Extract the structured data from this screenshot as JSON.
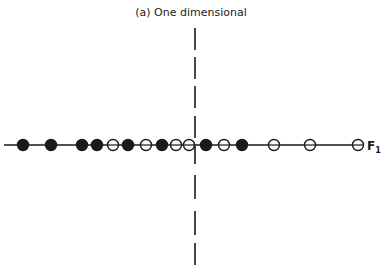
{
  "title": "(a) One dimensional",
  "axis": {
    "label_main": "F",
    "label_sub": "1",
    "line_x_start": 4,
    "line_x_end": 362,
    "line_y": 145,
    "color": "#1a1a1a"
  },
  "divider": {
    "x": 195,
    "segments": [
      [
        28,
        50
      ],
      [
        57,
        79
      ],
      [
        86,
        108
      ],
      [
        116,
        138
      ],
      [
        146,
        164
      ],
      [
        175,
        199
      ],
      [
        211,
        235
      ],
      [
        243,
        265
      ]
    ]
  },
  "points": [
    {
      "x": 23,
      "type": "filled"
    },
    {
      "x": 51,
      "type": "filled"
    },
    {
      "x": 82,
      "type": "filled"
    },
    {
      "x": 97,
      "type": "filled"
    },
    {
      "x": 113,
      "type": "open"
    },
    {
      "x": 128,
      "type": "filled"
    },
    {
      "x": 146,
      "type": "open"
    },
    {
      "x": 162,
      "type": "filled"
    },
    {
      "x": 176,
      "type": "open"
    },
    {
      "x": 189,
      "type": "open"
    },
    {
      "x": 206,
      "type": "filled"
    },
    {
      "x": 224,
      "type": "open"
    },
    {
      "x": 242,
      "type": "filled"
    },
    {
      "x": 274,
      "type": "open"
    },
    {
      "x": 310,
      "type": "open"
    },
    {
      "x": 358,
      "type": "open"
    }
  ]
}
